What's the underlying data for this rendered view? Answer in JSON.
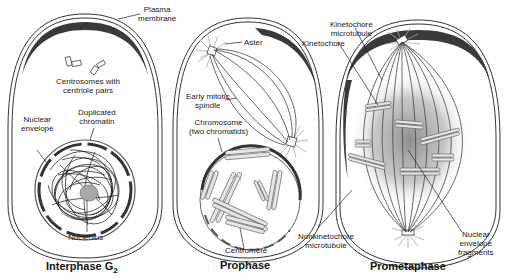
{
  "diagram": {
    "panels": [
      {
        "id": "interphase",
        "title": "Interphase G",
        "title_subscript": "2",
        "labels": {
          "plasma_membrane": "Plasma\nmembrane",
          "centrosomes": "Centrosomes with\ncentriole pairs",
          "duplicated_chromatin": "Duplicated\nchromatin",
          "nuclear_envelope": "Nuclear\nenvelope",
          "nucleolus": "Nucleolus"
        }
      },
      {
        "id": "prophase",
        "title": "Prophase",
        "labels": {
          "aster": "Aster",
          "early_mitotic_spindle": "Early mitotic\nspindle",
          "chromosome": "Chromosome\n(two chromatids)",
          "centromere": "Centromere"
        }
      },
      {
        "id": "prometaphase",
        "title": "Prometaphase",
        "labels": {
          "kinetochore_microtubule": "Kinetochore\nmicrotubule",
          "kinetochore": "Kinetochore",
          "nonkinetochore_microtubule": "Nonkinetochore\nmicrotubule",
          "nuclear_envelope_fragments": "Nuclear\nenvelope\nfragments"
        }
      }
    ],
    "colors": {
      "outline": "#333333",
      "cortex": "#3a3a3a",
      "chromosome_fill": "#e6e6e6",
      "nucleolus": "#a8a8a8",
      "shading": "#8a8a8a"
    }
  }
}
